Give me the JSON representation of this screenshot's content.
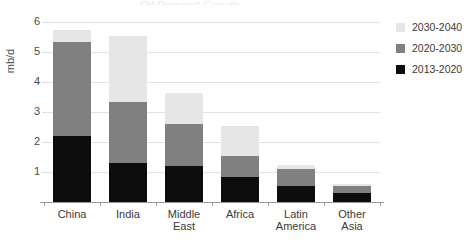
{
  "chart_data": {
    "type": "bar",
    "title": "Oil Demand Growth",
    "subtitle": "",
    "xlabel": "",
    "ylabel": "mb/d",
    "ylim": [
      0,
      6
    ],
    "yticks": [
      0,
      1,
      2,
      3,
      4,
      5,
      6
    ],
    "ytick_labels": [
      "",
      "1",
      "2",
      "3",
      "4",
      "5",
      "6"
    ],
    "grid": true,
    "stacked": true,
    "legend_position": "right",
    "categories": [
      "China",
      "India",
      "Middle East",
      "Africa",
      "Latin America",
      "Other Asia"
    ],
    "category_lines": [
      [
        "China"
      ],
      [
        "India"
      ],
      [
        "Middle",
        "East"
      ],
      [
        "Africa"
      ],
      [
        "Latin",
        "America"
      ],
      [
        "Other",
        "Asia"
      ]
    ],
    "series": [
      {
        "name": "2013-2020",
        "color": "#0d0d0d",
        "values": [
          2.2,
          1.3,
          1.2,
          0.85,
          0.55,
          0.3
        ]
      },
      {
        "name": "2020-2030",
        "color": "#808080",
        "values": [
          3.15,
          2.05,
          1.4,
          0.7,
          0.55,
          0.25
        ]
      },
      {
        "name": "2030-2040",
        "color": "#e6e6e6",
        "values": [
          0.4,
          2.2,
          1.05,
          1.0,
          0.15,
          0.05
        ]
      }
    ],
    "totals": [
      5.75,
      5.55,
      3.65,
      2.55,
      1.25,
      0.6
    ]
  },
  "legend": {
    "entries": [
      {
        "label": "2030-2040",
        "color": "#e6e6e6"
      },
      {
        "label": "2020-2030",
        "color": "#808080"
      },
      {
        "label": "2013-2020",
        "color": "#0d0d0d"
      }
    ]
  }
}
